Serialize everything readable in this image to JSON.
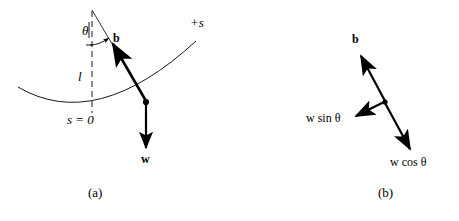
{
  "figure": {
    "background_color": "#ffffff",
    "ink_color": "#000000"
  },
  "panel_a": {
    "caption": "(a)",
    "labels": {
      "angle": "θ",
      "tension_vector": "b",
      "positive_s_axis": "+s",
      "length": "l",
      "origin_arc": "s = 0",
      "weight_vector": "w"
    },
    "elements": {
      "pivot": "pivot-apex",
      "string": "pendulum-string",
      "dashed_vertical": "vertical-reference-line",
      "angle_arc": "theta-angle-arc",
      "path_arc": "pendulum-path-arc",
      "bob": "pendulum-bob"
    }
  },
  "panel_b": {
    "caption": "(b)",
    "labels": {
      "tension_vector": "b",
      "tangential_component": "w sin θ",
      "radial_component": "w cos θ"
    },
    "elements": {
      "origin": "vector-origin-point",
      "vector_b": "vector-b-arrow",
      "vector_wsin": "vector-w-sin-theta-arrow",
      "vector_wcos": "vector-w-cos-theta-arrow"
    }
  }
}
